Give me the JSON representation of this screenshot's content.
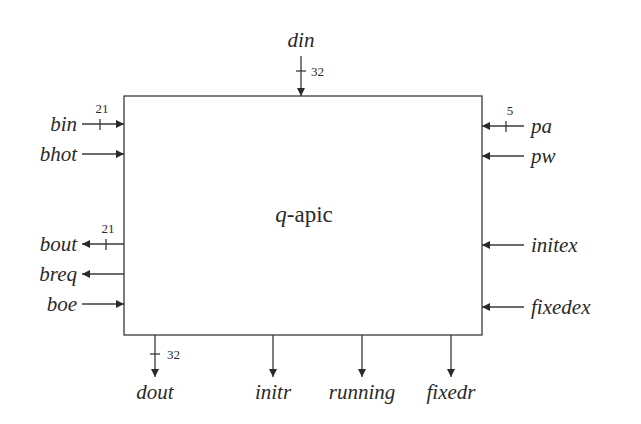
{
  "block": {
    "title_italic": "q",
    "title_rest": "-apic"
  },
  "signals": {
    "top": [
      {
        "name": "din",
        "direction": "in",
        "width": "32"
      }
    ],
    "left": [
      {
        "name": "bin",
        "direction": "in",
        "width": "21"
      },
      {
        "name": "bhot",
        "direction": "in",
        "width": ""
      },
      {
        "name": "bout",
        "direction": "out",
        "width": "21"
      },
      {
        "name": "breq",
        "direction": "out",
        "width": ""
      },
      {
        "name": "boe",
        "direction": "in",
        "width": ""
      }
    ],
    "right": [
      {
        "name": "pa",
        "direction": "in",
        "width": "5"
      },
      {
        "name": "pw",
        "direction": "in",
        "width": ""
      },
      {
        "name": "initex",
        "direction": "in",
        "width": ""
      },
      {
        "name": "fixedex",
        "direction": "in",
        "width": ""
      }
    ],
    "bottom": [
      {
        "name": "dout",
        "direction": "out",
        "width": "32"
      },
      {
        "name": "initr",
        "direction": "out",
        "width": ""
      },
      {
        "name": "running",
        "direction": "out",
        "width": ""
      },
      {
        "name": "fixedr",
        "direction": "out",
        "width": ""
      }
    ]
  }
}
